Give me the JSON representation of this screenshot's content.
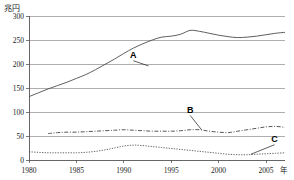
{
  "chart_data": {
    "type": "line",
    "title": "",
    "subtitle": "",
    "unit_label": "兆円",
    "xlabel": "年",
    "ylabel": "",
    "xlim": [
      1980,
      2007
    ],
    "ylim": [
      0,
      300
    ],
    "xticks": [
      "1980",
      "1985",
      "1990",
      "1995",
      "2000",
      "2005"
    ],
    "xtick_values": [
      1980,
      1985,
      1990,
      1995,
      2000,
      2005
    ],
    "yticks": [
      "0",
      "50",
      "100",
      "150",
      "200",
      "250",
      "300"
    ],
    "ytick_values": [
      0,
      50,
      100,
      150,
      200,
      250,
      300
    ],
    "grid": true,
    "legend_position": "inline-annotations",
    "x": [
      1980,
      1981,
      1982,
      1983,
      1984,
      1985,
      1986,
      1987,
      1988,
      1989,
      1990,
      1991,
      1992,
      1993,
      1994,
      1995,
      1996,
      1997,
      1998,
      1999,
      2000,
      2001,
      2002,
      2003,
      2004,
      2005,
      2006,
      2007
    ],
    "series": [
      {
        "name": "A",
        "style": "solid",
        "label": "A",
        "values": [
          132,
          140,
          148,
          155,
          162,
          170,
          178,
          188,
          199,
          210,
          222,
          233,
          242,
          250,
          256,
          258,
          262,
          270,
          268,
          264,
          260,
          257,
          255,
          256,
          258,
          261,
          264,
          266
        ]
      },
      {
        "name": "B",
        "style": "dash-dot",
        "label": "B",
        "values": [
          null,
          null,
          55,
          57,
          58,
          58,
          59,
          60,
          61,
          62,
          63,
          62,
          61,
          60,
          60,
          60,
          61,
          63,
          63,
          60,
          58,
          57,
          60,
          63,
          66,
          69,
          70,
          68
        ]
      },
      {
        "name": "C",
        "style": "dotted",
        "label": "C",
        "values": [
          17,
          16,
          15,
          15,
          15,
          15,
          16,
          18,
          21,
          25,
          29,
          31,
          30,
          28,
          26,
          24,
          22,
          20,
          18,
          16,
          14,
          12,
          11,
          11,
          12,
          13,
          14,
          15
        ]
      }
    ],
    "annotations": [
      {
        "text": "A",
        "x": 1991,
        "y": 212,
        "target_x": 1992.6,
        "target_y": 196
      },
      {
        "text": "B",
        "x": 1997,
        "y": 98,
        "target_x": 1998.2,
        "target_y": 63
      },
      {
        "text": "C",
        "x": 2005.9,
        "y": 37,
        "target_x": 2003.4,
        "target_y": 12
      }
    ]
  },
  "colors": {
    "grid": "#8c8c8c",
    "axis": "#555555",
    "series_a": "#4d4d4d",
    "series_b": "#3a3a3a",
    "series_c": "#4a4a4a",
    "text": "#1a1a1a",
    "background": "#ffffff"
  }
}
